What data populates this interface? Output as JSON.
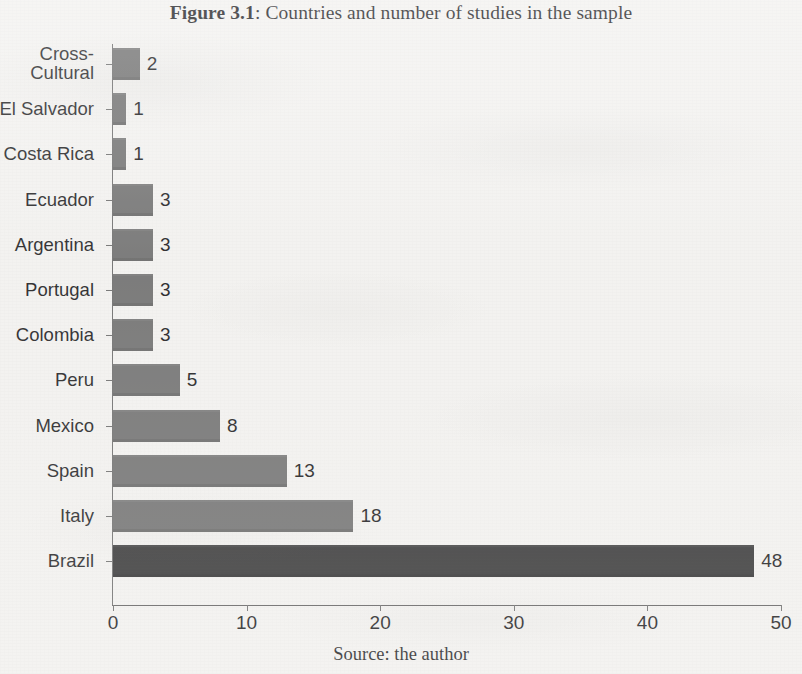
{
  "figure": {
    "number_label": "Figure 3.1",
    "title_separator": ": ",
    "title_text": "Countries and number of studies in the sample",
    "source_note": "Source: the author"
  },
  "colors": {
    "bar_default": "#6e6e6e",
    "bar_highlight": "#2f2f30",
    "axis": "#6b6b6b",
    "text": "#161618",
    "page_background": "#f3f2f0"
  },
  "chart_data": {
    "type": "bar",
    "orientation": "horizontal",
    "title": "Figure 3.1: Countries and number of studies in the sample",
    "xlabel": "",
    "ylabel": "",
    "xlim": [
      0,
      50
    ],
    "xticks": [
      0,
      10,
      20,
      30,
      40,
      50
    ],
    "xtick_labels": [
      "0",
      "10",
      "20",
      "30",
      "40",
      "50"
    ],
    "grid": false,
    "legend": false,
    "data_labels": true,
    "categories": [
      "Cross-\nCultural",
      "El Salvador",
      "Costa Rica",
      "Ecuador",
      "Argentina",
      "Portugal",
      "Colombia",
      "Peru",
      "Mexico",
      "Spain",
      "Italy",
      "Brazil"
    ],
    "values": [
      2,
      1,
      1,
      3,
      3,
      3,
      3,
      5,
      8,
      13,
      18,
      48
    ],
    "value_labels": [
      "2",
      "1",
      "1",
      "3",
      "3",
      "3",
      "3",
      "5",
      "8",
      "13",
      "18",
      "48"
    ],
    "highlight_index": 11,
    "source": "the author"
  }
}
